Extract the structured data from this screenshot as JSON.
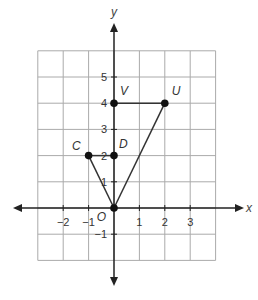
{
  "figure": {
    "axes": {
      "x_label": "x",
      "y_label": "y",
      "x_ticks": [
        {
          "value": -2,
          "label": "−2"
        },
        {
          "value": -1,
          "label": "−1"
        },
        {
          "value": 1,
          "label": "1"
        },
        {
          "value": 2,
          "label": "2"
        },
        {
          "value": 3,
          "label": "3"
        }
      ],
      "y_ticks": [
        {
          "value": 5,
          "label": "5"
        },
        {
          "value": 4,
          "label": "4"
        },
        {
          "value": 3,
          "label": "3"
        },
        {
          "value": 2,
          "label": "2"
        },
        {
          "value": 1,
          "label": "1"
        },
        {
          "value": -1,
          "label": "−1"
        }
      ],
      "origin_label": "O"
    },
    "grid": {
      "x_range": [
        -3,
        4
      ],
      "y_range": [
        -2,
        6
      ],
      "color": "#aaaaaa"
    },
    "points": [
      {
        "name": "V",
        "x": 0,
        "y": 4
      },
      {
        "name": "U",
        "x": 2,
        "y": 4
      },
      {
        "name": "C",
        "x": -1,
        "y": 2
      },
      {
        "name": "D",
        "x": 0,
        "y": 2
      },
      {
        "name": "O",
        "x": 0,
        "y": 0
      }
    ],
    "segments": [
      [
        "V",
        "U"
      ],
      [
        "U",
        "O"
      ],
      [
        "C",
        "D"
      ],
      [
        "C",
        "O"
      ]
    ],
    "colors": {
      "line": "#333333",
      "axis": "#222222",
      "point": "#111111"
    }
  }
}
